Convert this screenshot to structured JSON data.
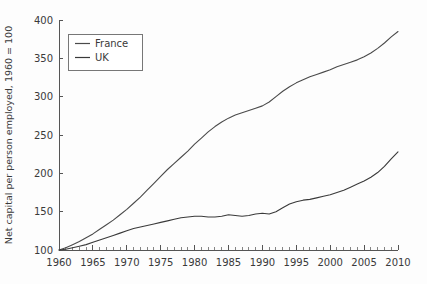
{
  "figure": {
    "background_color": "#fdfdfd",
    "axis_color": "#555555",
    "text_color": "#3a3a3a"
  },
  "chart_data": {
    "type": "line",
    "title": "",
    "xlabel": "",
    "ylabel": "Net capital per person employed, 1960 = 100",
    "xlim": [
      1960,
      2010
    ],
    "ylim": [
      100,
      400
    ],
    "grid": false,
    "legend_position": "upper-left-inside",
    "xticks": [
      1960,
      1965,
      1970,
      1975,
      1980,
      1985,
      1990,
      1995,
      2000,
      2005,
      2010
    ],
    "xtick_labels": [
      "1960",
      "1965",
      "1970",
      "1975",
      "1980",
      "1985",
      "1990",
      "1995",
      "2000",
      "2005",
      "2010"
    ],
    "xminor_tick_step": 1,
    "yticks": [
      100,
      150,
      200,
      250,
      300,
      350,
      400
    ],
    "ytick_labels": [
      "100",
      "150",
      "200",
      "250",
      "300",
      "350",
      "400"
    ],
    "x": [
      1960,
      1961,
      1962,
      1963,
      1964,
      1965,
      1966,
      1967,
      1968,
      1969,
      1970,
      1971,
      1972,
      1973,
      1974,
      1975,
      1976,
      1977,
      1978,
      1979,
      1980,
      1981,
      1982,
      1983,
      1984,
      1985,
      1986,
      1987,
      1988,
      1989,
      1990,
      1991,
      1992,
      1993,
      1994,
      1995,
      1996,
      1997,
      1998,
      1999,
      2000,
      2001,
      2002,
      2003,
      2004,
      2005,
      2006,
      2007,
      2008,
      2009,
      2010
    ],
    "series": [
      {
        "name": "France",
        "color": "#4a4a4a",
        "values": [
          100,
          103,
          107,
          111,
          116,
          121,
          127,
          133,
          139,
          146,
          153,
          161,
          169,
          178,
          187,
          196,
          205,
          213,
          221,
          229,
          238,
          246,
          254,
          261,
          267,
          272,
          276,
          279,
          282,
          285,
          288,
          293,
          300,
          307,
          313,
          318,
          322,
          326,
          329,
          332,
          335,
          339,
          342,
          345,
          348,
          352,
          357,
          363,
          370,
          378,
          385
        ]
      },
      {
        "name": "UK",
        "color": "#3a3a3a",
        "values": [
          100,
          101,
          103,
          105,
          107,
          110,
          113,
          116,
          119,
          122,
          125,
          128,
          130,
          132,
          134,
          136,
          138,
          140,
          142,
          143,
          144,
          144,
          143,
          143,
          144,
          146,
          145,
          144,
          145,
          147,
          148,
          147,
          150,
          155,
          160,
          163,
          165,
          166,
          168,
          170,
          172,
          175,
          178,
          182,
          186,
          190,
          195,
          201,
          209,
          219,
          228
        ]
      }
    ]
  },
  "legend": {
    "entries": [
      {
        "label": "France",
        "color": "#4a4a4a"
      },
      {
        "label": "UK",
        "color": "#3a3a3a"
      }
    ]
  }
}
